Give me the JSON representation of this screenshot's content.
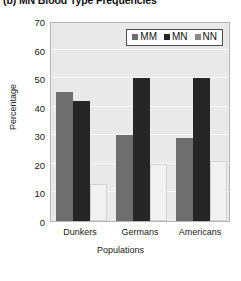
{
  "chart_data": {
    "type": "bar",
    "title": "(b) MN Blood Type Frequencies",
    "xlabel": "Populations",
    "ylabel": "Percentage",
    "categories": [
      "Dunkers",
      "Germans",
      "Americans"
    ],
    "series": [
      {
        "name": "MM",
        "values": [
          45,
          30,
          29
        ],
        "color": "#6e6e6e"
      },
      {
        "name": "MN",
        "values": [
          42,
          50,
          50
        ],
        "color": "#262626"
      },
      {
        "name": "NN",
        "values": [
          13,
          20,
          21
        ],
        "color": "#f1f1f1"
      }
    ],
    "ylim": [
      0,
      70
    ],
    "yticks": [
      0,
      10,
      20,
      30,
      40,
      50,
      60,
      70
    ],
    "ytick_labels": [
      "0",
      "10",
      "20",
      "30",
      "40",
      "50",
      "60",
      "70"
    ],
    "grid": true,
    "legend_position": "top-right",
    "plot_background": "#e9e9e9"
  }
}
